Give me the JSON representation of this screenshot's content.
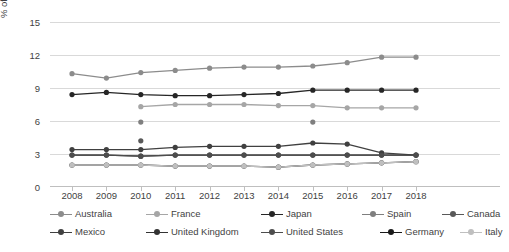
{
  "chart_data": {
    "type": "line",
    "title": "",
    "xlabel": "",
    "ylabel": "% of tourism contribution in GDP",
    "ylim": [
      0,
      15
    ],
    "yticks": [
      0,
      3,
      6,
      9,
      12,
      15
    ],
    "grid": true,
    "legend_position": "bottom",
    "categories": [
      "2008",
      "2009",
      "2010",
      "2011",
      "2012",
      "2013",
      "2014",
      "2015",
      "2016",
      "2017",
      "2018"
    ],
    "series": [
      {
        "name": "Australia",
        "color": "#8c8c8c",
        "values": [
          10.3,
          9.9,
          10.4,
          10.6,
          10.8,
          10.9,
          10.9,
          11.0,
          11.3,
          11.8,
          11.8
        ]
      },
      {
        "name": "France",
        "color": "#a6a6a6",
        "values": [
          null,
          null,
          7.3,
          7.5,
          7.5,
          7.5,
          7.4,
          7.4,
          7.2,
          7.2,
          7.2
        ]
      },
      {
        "name": "Japan",
        "color": "#262626",
        "values": [
          8.4,
          8.6,
          8.4,
          8.3,
          8.3,
          8.4,
          8.5,
          8.8,
          8.8,
          8.8,
          8.8
        ]
      },
      {
        "name": "Spain",
        "color": "#7f7f7f",
        "values": [
          null,
          null,
          5.9,
          null,
          null,
          null,
          null,
          5.9,
          null,
          null,
          null
        ]
      },
      {
        "name": "Canada",
        "color": "#595959",
        "values": [
          null,
          null,
          4.2,
          null,
          null,
          null,
          null,
          null,
          null,
          null,
          null
        ]
      },
      {
        "name": "Mexico",
        "color": "#404040",
        "values": [
          3.4,
          3.4,
          3.4,
          3.6,
          3.7,
          3.7,
          3.7,
          4.0,
          3.9,
          3.1,
          2.9
        ]
      },
      {
        "name": "United Kingdom",
        "color": "#333333",
        "values": [
          2.9,
          2.9,
          2.8,
          2.9,
          2.9,
          2.9,
          2.9,
          2.9,
          2.9,
          2.9,
          2.9
        ]
      },
      {
        "name": "United States",
        "color": "#4d4d4d",
        "values": [
          2.9,
          2.9,
          2.8,
          2.9,
          2.9,
          2.9,
          2.9,
          2.9,
          2.9,
          2.9,
          2.9
        ]
      },
      {
        "name": "Germany",
        "color": "#1a1a1a",
        "values": [
          2.0,
          2.0,
          2.0,
          1.9,
          1.9,
          1.9,
          1.8,
          2.0,
          2.1,
          2.2,
          2.3
        ]
      },
      {
        "name": "Italy",
        "color": "#bfbfbf",
        "values": [
          2.0,
          2.0,
          2.0,
          1.9,
          1.9,
          1.9,
          1.8,
          2.0,
          2.1,
          2.2,
          2.3
        ]
      }
    ]
  },
  "legend": {
    "row1": [
      "Australia",
      "France",
      "Japan",
      "Spain",
      "Canada"
    ],
    "row2": [
      "Mexico",
      "United Kingdom",
      "United States",
      "Germany",
      "Italy"
    ]
  }
}
